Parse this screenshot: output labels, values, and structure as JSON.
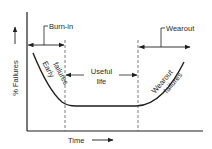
{
  "diagram": {
    "type": "bathtub-curve",
    "colors": {
      "line": "#1e1e1e",
      "text": "#2a2a2a",
      "background": "#ffffff"
    },
    "axes": {
      "y_label": "% Failures",
      "x_label": "Time"
    },
    "regions": [
      {
        "name": "Burn-in",
        "curve_label_line1": "Early",
        "curve_label_line2": "failures"
      },
      {
        "name": "Useful life",
        "label_line1": "Useful",
        "label_line2": "life"
      },
      {
        "name": "Wearout",
        "curve_label_line1": "Wearout",
        "curve_label_line2": "failures"
      }
    ],
    "labels": {
      "burn_in": "Burn-in",
      "wearout": "Wearout",
      "useful": "Useful",
      "life": "life",
      "early": "Early",
      "early_failures": "failures",
      "wearout_curve": "Wearout",
      "wearout_failures": "failures",
      "y_axis": "% Failures",
      "x_axis": "Time"
    }
  }
}
